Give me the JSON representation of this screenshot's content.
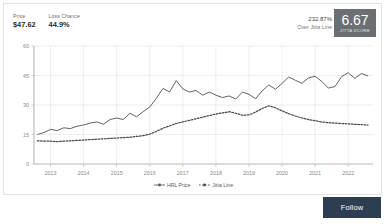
{
  "header": {
    "stats": [
      {
        "label": "Price",
        "value": "$47.62",
        "name": "price"
      },
      {
        "label": "Loss Chance",
        "value": "44.9%",
        "name": "loss-chance"
      }
    ],
    "over_jitta_percent": "232.87%",
    "over_jitta_caption": "Over Jitta Line",
    "score": "6.67",
    "score_caption": "JITTA SCORE",
    "score_box_color": "#6b6f72"
  },
  "footer": {
    "follow_label": "Follow",
    "follow_color": "#2d3d52"
  },
  "chart_data": {
    "type": "line",
    "title": "",
    "xlabel": "",
    "ylabel": "",
    "ylim": [
      0,
      60
    ],
    "yticks": [
      0,
      15,
      30,
      45,
      60
    ],
    "xticks": [
      "2013",
      "2014",
      "2015",
      "2016",
      "2017",
      "2018",
      "2019",
      "2020",
      "2021",
      "2022"
    ],
    "grid": true,
    "legend_position": "bottom-center",
    "x": [
      2012.6,
      2012.8,
      2013.0,
      2013.2,
      2013.4,
      2013.6,
      2013.8,
      2014.0,
      2014.2,
      2014.4,
      2014.6,
      2014.8,
      2015.0,
      2015.2,
      2015.4,
      2015.6,
      2015.8,
      2016.0,
      2016.2,
      2016.4,
      2016.6,
      2016.8,
      2017.0,
      2017.2,
      2017.4,
      2017.6,
      2017.8,
      2018.0,
      2018.2,
      2018.4,
      2018.6,
      2018.8,
      2019.0,
      2019.2,
      2019.4,
      2019.6,
      2019.8,
      2020.0,
      2020.2,
      2020.4,
      2020.6,
      2020.8,
      2021.0,
      2021.2,
      2021.4,
      2021.6,
      2021.8,
      2022.0,
      2022.2,
      2022.4,
      2022.6
    ],
    "series": [
      {
        "name": "HRL Price",
        "style": "solid",
        "color": "#5a5a5a",
        "values": [
          15.0,
          16.0,
          17.6,
          17.0,
          18.4,
          18.0,
          19.2,
          19.8,
          20.8,
          21.4,
          20.2,
          22.6,
          23.4,
          22.6,
          25.8,
          24.0,
          26.6,
          29.0,
          33.4,
          38.4,
          36.6,
          42.4,
          38.2,
          36.6,
          37.4,
          35.0,
          36.6,
          35.0,
          33.8,
          34.6,
          33.0,
          36.6,
          35.4,
          33.2,
          37.2,
          40.2,
          38.0,
          41.0,
          44.2,
          42.6,
          41.0,
          43.8,
          44.6,
          42.0,
          38.6,
          39.4,
          44.4,
          46.4,
          43.6,
          46.0,
          44.8
        ]
      },
      {
        "name": "Jitta Line",
        "style": "dotted",
        "color": "#4a4a4a",
        "values": [
          11.8,
          11.6,
          11.6,
          11.4,
          11.6,
          11.8,
          12.0,
          12.2,
          12.4,
          12.6,
          12.8,
          13.0,
          13.2,
          13.4,
          13.6,
          14.0,
          14.4,
          15.2,
          16.6,
          18.2,
          19.4,
          20.6,
          21.4,
          22.2,
          23.0,
          23.8,
          24.6,
          25.4,
          26.0,
          26.6,
          25.8,
          24.8,
          25.0,
          26.4,
          28.2,
          29.6,
          28.6,
          27.0,
          25.6,
          24.4,
          23.4,
          22.6,
          22.0,
          21.4,
          21.0,
          20.8,
          20.6,
          20.4,
          20.2,
          20.0,
          19.8
        ]
      }
    ]
  }
}
